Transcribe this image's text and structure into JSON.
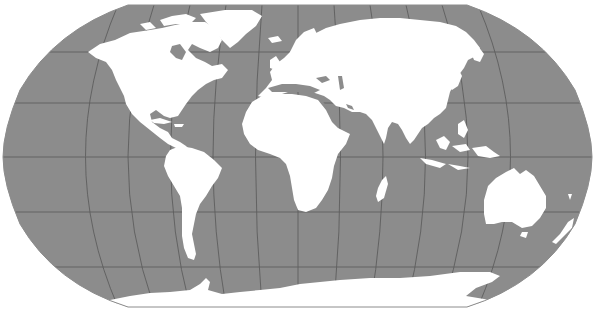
{
  "map": {
    "projection": "robinson",
    "title_fragment": "",
    "colors": {
      "ocean": "#8c8c8c",
      "land": "#ffffff",
      "graticule": "#5a5a5a",
      "background": "#ffffff"
    },
    "graticule": {
      "parallels_deg": [
        60,
        30,
        0,
        -30,
        -60
      ],
      "meridian_step_deg": 30
    },
    "regions": [
      {
        "name": "North America",
        "type": "continent"
      },
      {
        "name": "Greenland",
        "type": "island"
      },
      {
        "name": "South America",
        "type": "continent"
      },
      {
        "name": "Europe",
        "type": "continent"
      },
      {
        "name": "Africa",
        "type": "continent"
      },
      {
        "name": "Madagascar",
        "type": "island"
      },
      {
        "name": "Asia",
        "type": "continent"
      },
      {
        "name": "Japan",
        "type": "island"
      },
      {
        "name": "Southeast Asia",
        "type": "archipelago"
      },
      {
        "name": "Australia",
        "type": "continent"
      },
      {
        "name": "New Zealand",
        "type": "island"
      },
      {
        "name": "Antarctica",
        "type": "continent"
      }
    ]
  }
}
